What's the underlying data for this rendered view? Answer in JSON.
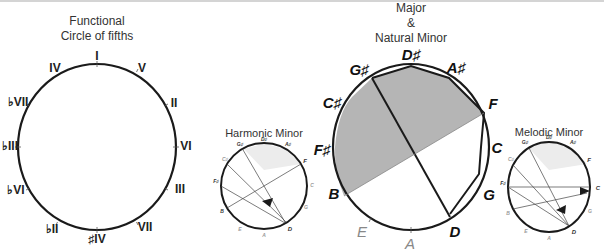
{
  "header": {
    "rule_color": "#d4d4d4"
  },
  "functional": {
    "title_line1": "Functional",
    "title_line2": "Circle of fifths",
    "labels": [
      "I",
      "V",
      "II",
      "VI",
      "III",
      "VII",
      "#IV",
      "bII",
      "bVI",
      "bIII",
      "bVII",
      "IV"
    ]
  },
  "harmonic": {
    "title": "Harmonic Minor",
    "labels": [
      "D#",
      "A#",
      "F",
      "C",
      "G",
      "D",
      "A",
      "E",
      "B",
      "F#",
      "C#",
      "G#"
    ]
  },
  "major": {
    "title_line1": "Major",
    "title_line2": "&",
    "title_line3": "Natural Minor",
    "labels": [
      "D#",
      "A#",
      "F",
      "C",
      "G",
      "D",
      "A",
      "E",
      "B",
      "F#",
      "C#",
      "G#"
    ],
    "highlight_labels": [
      "D#",
      "A#",
      "F",
      "C",
      "G",
      "D",
      "B",
      "F#",
      "C#",
      "G#"
    ],
    "faded_labels": [
      "A",
      "E"
    ]
  },
  "melodic": {
    "title": "Melodic Minor",
    "labels": [
      "D#",
      "A#",
      "F",
      "C",
      "G",
      "D",
      "A",
      "E",
      "B",
      "F#",
      "C#",
      "G#"
    ]
  },
  "colors": {
    "stroke": "#1a1a1a",
    "shade": "#b5b5b5",
    "light_shade": "#ececec",
    "faded_text": "#888888"
  }
}
